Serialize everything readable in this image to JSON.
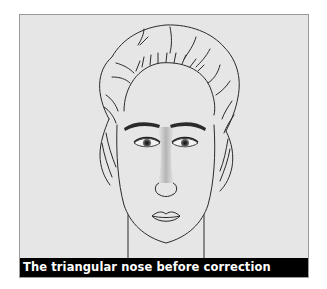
{
  "figure": {
    "caption": "The triangular nose before correction",
    "colors": {
      "panel_background": "#e6e6e6",
      "line": "#2a2a2a",
      "caption_bar": "#000000",
      "caption_text": "#ffffff"
    }
  }
}
